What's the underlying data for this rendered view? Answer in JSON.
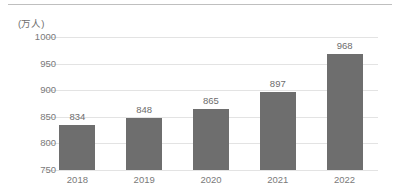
{
  "chart_data": {
    "type": "bar",
    "title": "",
    "subtitle": "",
    "unit_label": "(万人)",
    "xlabel": "",
    "ylabel": "",
    "categories": [
      "2018",
      "2019",
      "2020",
      "2021",
      "2022"
    ],
    "values": [
      834,
      848,
      865,
      897,
      968
    ],
    "data_labels": [
      "834",
      "848",
      "865",
      "897",
      "968"
    ],
    "ylim": [
      750,
      1000
    ],
    "ytick_step": 50,
    "ytick_labels": [
      "1000",
      "950",
      "900",
      "850",
      "800",
      "750"
    ],
    "ytick_values": [
      1000,
      950,
      900,
      850,
      800,
      750
    ],
    "grid": true,
    "grid_orientation": "horizontal",
    "legend": false,
    "legend_position": "none",
    "series": [
      {
        "name": "",
        "values": [
          834,
          848,
          865,
          897,
          968
        ],
        "color": "#6E6E6E"
      }
    ],
    "colors": {
      "bar": "#6E6E6E",
      "gridline": "#E3E3E3",
      "tick_text": "#7A7A7A",
      "label_text": "#6D6D6D",
      "top_rule": "#BFBFBF",
      "background": "#FFFFFF"
    }
  }
}
